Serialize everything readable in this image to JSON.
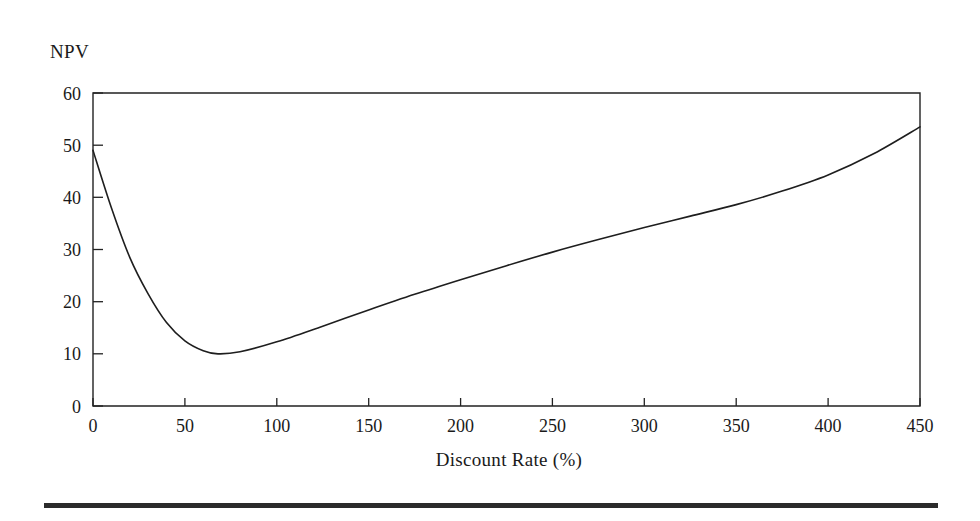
{
  "figure": {
    "name": "npv-vs-discount-rate-chart",
    "background_color": "#ffffff",
    "line_color": "#1e1e1e",
    "axis_color": "#222222",
    "rule_color": "#2b2b2b"
  },
  "chart_data": {
    "type": "line",
    "title": "",
    "subtitle": "",
    "xlabel": "Discount Rate (%)",
    "ylabel": "NPV",
    "xlim": [
      0,
      450
    ],
    "ylim": [
      0,
      60
    ],
    "xticks": [
      0,
      50,
      100,
      150,
      200,
      250,
      300,
      350,
      400,
      450
    ],
    "xtick_labels": [
      "0",
      "50",
      "100",
      "150",
      "200",
      "250",
      "300",
      "350",
      "400",
      "450"
    ],
    "yticks": [
      0,
      10,
      20,
      30,
      40,
      50,
      60
    ],
    "ytick_labels": [
      "0",
      "10",
      "20",
      "30",
      "40",
      "50",
      "60"
    ],
    "grid": false,
    "legend": null,
    "legend_position": "none",
    "annotations": [],
    "series": [
      {
        "name": "NPV",
        "x": [
          0,
          10,
          20,
          30,
          40,
          50,
          60,
          68,
          80,
          100,
          125,
          150,
          175,
          200,
          225,
          250,
          275,
          300,
          325,
          350,
          375,
          400,
          425,
          450
        ],
        "y": [
          49.0,
          38.0,
          28.5,
          21.5,
          16.0,
          12.5,
          10.6,
          10.0,
          10.4,
          12.3,
          15.3,
          18.4,
          21.4,
          24.2,
          26.9,
          29.5,
          31.9,
          34.2,
          36.4,
          38.6,
          41.2,
          44.3,
          48.4,
          53.5
        ]
      }
    ],
    "key_points": {
      "start": {
        "x": 0,
        "y": 49.0
      },
      "minimum": {
        "x": 68,
        "y": 10.0
      },
      "end": {
        "x": 450,
        "y": 53.5
      }
    }
  }
}
